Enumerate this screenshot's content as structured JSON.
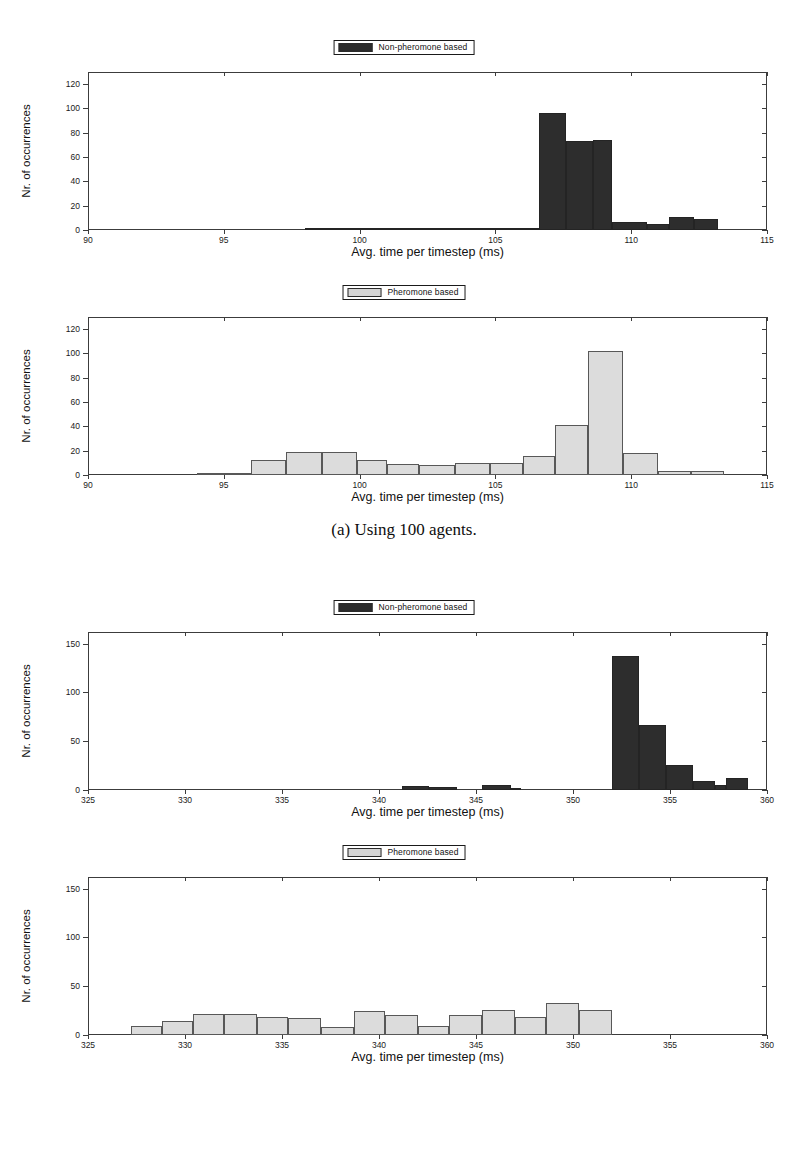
{
  "figure": {
    "subfigures": [
      {
        "caption": "(a) Using 100 agents.",
        "panels": [
          "nonpheromone_100",
          "pheromone_100"
        ]
      },
      {
        "caption": "(b) Using 250 agents.",
        "panels": [
          "nonpheromone_250",
          "pheromone_250"
        ]
      }
    ]
  },
  "labels": {
    "ylabel": "Nr. of occurrences",
    "xlabel": "Avg. time per timestep (ms)",
    "legend_nonpheromone": "Non-pheromone based",
    "legend_pheromone": "Pheromone based"
  },
  "colors": {
    "dark_series": "#2d2d2d",
    "light_series": "#dcdcdc",
    "light_series_edge": "#585858",
    "axis": "#3c3c3c",
    "text": "#111111"
  },
  "chart_data": [
    {
      "id": "nonpheromone_100",
      "type": "bar",
      "title": "Non-pheromone based",
      "subfigure": "(a) Using 100 agents.",
      "xlabel": "Avg. time per timestep (ms)",
      "ylabel": "Nr. of occurrences",
      "xlim": [
        90,
        115
      ],
      "ylim": [
        0,
        130
      ],
      "xticks": [
        90,
        95,
        100,
        105,
        110,
        115
      ],
      "yticks": [
        0,
        20,
        40,
        60,
        80,
        100,
        120
      ],
      "grid": false,
      "legend_position": "above-center",
      "bin_width": 1.0,
      "bins": [
        {
          "start": 98.0,
          "end": 99.0,
          "value": 1
        },
        {
          "start": 99.0,
          "end": 100.0,
          "value": 1
        },
        {
          "start": 100.0,
          "end": 101.0,
          "value": 2
        },
        {
          "start": 101.0,
          "end": 102.0,
          "value": 1
        },
        {
          "start": 102.0,
          "end": 103.0,
          "value": 2
        },
        {
          "start": 103.0,
          "end": 104.0,
          "value": 2
        },
        {
          "start": 104.0,
          "end": 105.0,
          "value": 1
        },
        {
          "start": 105.0,
          "end": 106.0,
          "value": 2
        },
        {
          "start": 106.0,
          "end": 106.6,
          "value": 2
        },
        {
          "start": 106.6,
          "end": 107.6,
          "value": 96
        },
        {
          "start": 107.6,
          "end": 108.6,
          "value": 73
        },
        {
          "start": 108.6,
          "end": 109.3,
          "value": 74
        },
        {
          "start": 109.3,
          "end": 110.6,
          "value": 7
        },
        {
          "start": 110.6,
          "end": 111.4,
          "value": 5
        },
        {
          "start": 111.4,
          "end": 112.3,
          "value": 11
        },
        {
          "start": 112.3,
          "end": 113.2,
          "value": 9
        }
      ]
    },
    {
      "id": "pheromone_100",
      "type": "bar",
      "title": "Pheromone based",
      "subfigure": "(a) Using 100 agents.",
      "xlabel": "Avg. time per timestep (ms)",
      "ylabel": "Nr. of occurrences",
      "xlim": [
        90,
        115
      ],
      "ylim": [
        0,
        130
      ],
      "xticks": [
        90,
        95,
        100,
        105,
        110,
        115
      ],
      "yticks": [
        0,
        20,
        40,
        60,
        80,
        100,
        120
      ],
      "grid": false,
      "legend_position": "above-center",
      "bin_width": 1.2,
      "bins": [
        {
          "start": 94.0,
          "end": 95.0,
          "value": 1
        },
        {
          "start": 95.0,
          "end": 96.0,
          "value": 2
        },
        {
          "start": 96.0,
          "end": 97.3,
          "value": 12
        },
        {
          "start": 97.3,
          "end": 98.6,
          "value": 19
        },
        {
          "start": 98.6,
          "end": 99.9,
          "value": 19
        },
        {
          "start": 99.9,
          "end": 101.0,
          "value": 12
        },
        {
          "start": 101.0,
          "end": 102.2,
          "value": 9
        },
        {
          "start": 102.2,
          "end": 103.5,
          "value": 8
        },
        {
          "start": 103.5,
          "end": 104.8,
          "value": 10
        },
        {
          "start": 104.8,
          "end": 106.0,
          "value": 10
        },
        {
          "start": 106.0,
          "end": 107.2,
          "value": 16
        },
        {
          "start": 107.2,
          "end": 108.4,
          "value": 41
        },
        {
          "start": 108.4,
          "end": 109.7,
          "value": 102
        },
        {
          "start": 109.7,
          "end": 111.0,
          "value": 18
        },
        {
          "start": 111.0,
          "end": 112.2,
          "value": 3
        },
        {
          "start": 112.2,
          "end": 113.4,
          "value": 3
        }
      ]
    },
    {
      "id": "nonpheromone_250",
      "type": "bar",
      "title": "Non-pheromone based",
      "subfigure": "(b) Using 250 agents.",
      "xlabel": "Avg. time per timestep (ms)",
      "ylabel": "Nr. of occurrences",
      "xlim": [
        325,
        360
      ],
      "ylim": [
        0,
        162
      ],
      "xticks": [
        325,
        330,
        335,
        340,
        345,
        350,
        355,
        360
      ],
      "yticks": [
        0,
        50,
        100,
        150
      ],
      "grid": false,
      "legend_position": "above-center",
      "bin_width": 1.4,
      "bins": [
        {
          "start": 341.2,
          "end": 342.6,
          "value": 4
        },
        {
          "start": 342.6,
          "end": 344.0,
          "value": 3
        },
        {
          "start": 345.3,
          "end": 346.8,
          "value": 5
        },
        {
          "start": 346.8,
          "end": 347.3,
          "value": 2
        },
        {
          "start": 352.0,
          "end": 353.4,
          "value": 137
        },
        {
          "start": 353.4,
          "end": 354.8,
          "value": 67
        },
        {
          "start": 354.8,
          "end": 356.2,
          "value": 26
        },
        {
          "start": 356.2,
          "end": 357.3,
          "value": 9
        },
        {
          "start": 357.3,
          "end": 357.9,
          "value": 5
        },
        {
          "start": 357.9,
          "end": 359.0,
          "value": 12
        }
      ]
    },
    {
      "id": "pheromone_250",
      "type": "bar",
      "title": "Pheromone based",
      "subfigure": "(b) Using 250 agents.",
      "xlabel": "Avg. time per timestep (ms)",
      "ylabel": "Nr. of occurrences",
      "xlim": [
        325,
        360
      ],
      "ylim": [
        0,
        162
      ],
      "xticks": [
        325,
        330,
        335,
        340,
        345,
        350,
        355,
        360
      ],
      "yticks": [
        0,
        50,
        100,
        150
      ],
      "grid": false,
      "legend_position": "above-center",
      "bin_width": 1.65,
      "bins": [
        {
          "start": 327.2,
          "end": 328.8,
          "value": 9
        },
        {
          "start": 328.8,
          "end": 330.4,
          "value": 14
        },
        {
          "start": 330.4,
          "end": 332.0,
          "value": 22
        },
        {
          "start": 332.0,
          "end": 333.7,
          "value": 22
        },
        {
          "start": 333.7,
          "end": 335.3,
          "value": 18
        },
        {
          "start": 335.3,
          "end": 337.0,
          "value": 17
        },
        {
          "start": 337.0,
          "end": 338.7,
          "value": 8
        },
        {
          "start": 338.7,
          "end": 340.3,
          "value": 25
        },
        {
          "start": 340.3,
          "end": 342.0,
          "value": 21
        },
        {
          "start": 342.0,
          "end": 343.6,
          "value": 9
        },
        {
          "start": 343.6,
          "end": 345.3,
          "value": 21
        },
        {
          "start": 345.3,
          "end": 347.0,
          "value": 26
        },
        {
          "start": 347.0,
          "end": 348.6,
          "value": 18
        },
        {
          "start": 348.6,
          "end": 350.3,
          "value": 33
        },
        {
          "start": 350.3,
          "end": 352.0,
          "value": 26
        }
      ]
    }
  ],
  "page_bottom_text": ""
}
